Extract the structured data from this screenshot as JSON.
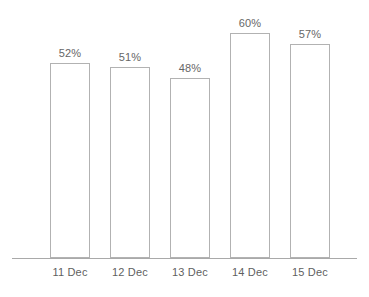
{
  "chart_data": {
    "type": "bar",
    "title": "",
    "subtitle": "",
    "xlabel": "",
    "ylabel": "",
    "categories": [
      "11 Dec",
      "12 Dec",
      "13 Dec",
      "14 Dec",
      "15 Dec"
    ],
    "values": [
      52,
      51,
      48,
      60,
      57
    ],
    "value_labels": [
      "52%",
      "51%",
      "48%",
      "60%",
      "57%"
    ],
    "unit": "%",
    "ylim": [
      0,
      64
    ],
    "grid": false,
    "legend": null,
    "legend_position": "none",
    "annotations": [],
    "axis": {
      "x_axis_visible": true,
      "y_axis_visible": false,
      "y_ticks": [],
      "x_ticks": [
        "11 Dec",
        "12 Dec",
        "13 Dec",
        "14 Dec",
        "15 Dec"
      ]
    },
    "style": {
      "bar_fill": "#ffffff",
      "bar_border": "#b2b2b2",
      "axis_color": "#a9a9a9",
      "value_label_color": "#666666",
      "category_label_color": "#5f5f5f",
      "background": "#ffffff"
    }
  }
}
